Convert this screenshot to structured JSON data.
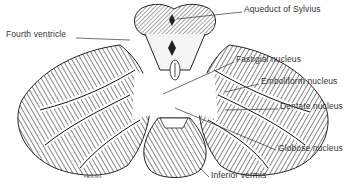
{
  "figure": {
    "labels": [
      {
        "id": "aqueduct",
        "text": "Aqueduct of Sylvius",
        "x": 244,
        "y": 10
      },
      {
        "id": "fourth-ventricle",
        "text": "Fourth ventricle",
        "x": 6,
        "y": 35
      },
      {
        "id": "fastigial",
        "text": "Fastigial nucleus",
        "x": 236,
        "y": 60
      },
      {
        "id": "emboliform",
        "text": "Emboliform nucleus",
        "x": 261,
        "y": 82
      },
      {
        "id": "dentate",
        "text": "Dentate nucleus",
        "x": 280,
        "y": 107
      },
      {
        "id": "globose",
        "text": "Globose nucleus",
        "x": 278,
        "y": 149
      },
      {
        "id": "inferior-vermis",
        "text": "Inferior vermis",
        "x": 211,
        "y": 176
      }
    ],
    "signature": "FANING",
    "colors": {
      "ink": "#222222",
      "label": "#333333",
      "background": "#ffffff",
      "shade": "#d8d8d8"
    }
  }
}
